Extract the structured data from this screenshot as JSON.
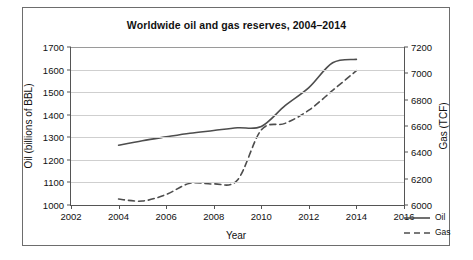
{
  "chart_data": {
    "type": "line",
    "title": "Worldwide oil and gas reserves, 2004–2014",
    "xlabel": "Year",
    "ylabel": "Oil (billions of BBL)",
    "ylabel_right": "Gas (TCF)",
    "xlim": [
      2002,
      2016
    ],
    "ylim": [
      1000,
      1700
    ],
    "ylim_right": [
      6000,
      7200
    ],
    "xticks": [
      2002,
      2004,
      2006,
      2008,
      2010,
      2012,
      2014,
      2016
    ],
    "yticks_left": [
      1000,
      1100,
      1200,
      1300,
      1400,
      1500,
      1600,
      1700
    ],
    "yticks_right": [
      6000,
      6200,
      6400,
      6600,
      6800,
      7000,
      7200
    ],
    "grid": true,
    "legend_position": "inside-lower-right",
    "x": [
      2004,
      2005,
      2006,
      2007,
      2008,
      2009,
      2010,
      2011,
      2012,
      2013,
      2014
    ],
    "series": [
      {
        "name": "Oil",
        "axis": "left",
        "units": "billions of BBL",
        "style": "solid",
        "color": "#4d4d4d",
        "values": [
          1265,
          1285,
          1302,
          1318,
          1330,
          1342,
          1348,
          1440,
          1520,
          1630,
          1645
        ]
      },
      {
        "name": "Gas",
        "axis": "right",
        "units": "TCF",
        "style": "dashed",
        "color": "#4d4d4d",
        "values": [
          6045,
          6030,
          6080,
          6165,
          6160,
          6190,
          6570,
          6620,
          6720,
          6870,
          7020
        ]
      }
    ]
  },
  "legend": {
    "items": [
      {
        "label": "Oil",
        "style": "solid"
      },
      {
        "label": "Gas",
        "style": "dashed"
      }
    ]
  }
}
